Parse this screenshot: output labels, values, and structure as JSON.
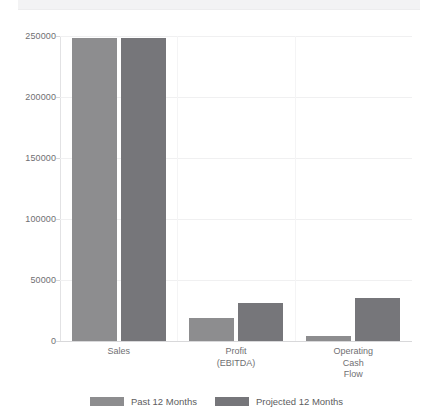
{
  "chart_data": {
    "type": "bar",
    "title": "",
    "xlabel": "",
    "ylabel": "",
    "categories": [
      "Sales",
      "Profit\n(EBITDA)",
      "Operating\nCash\nFlow"
    ],
    "series": [
      {
        "name": "Past 12 Months",
        "color": "#8d8d8f",
        "values": [
          248000,
          19000,
          4500
        ]
      },
      {
        "name": "Projected 12 Months",
        "color": "#76767a",
        "values": [
          248000,
          31000,
          35000
        ]
      }
    ],
    "ylim": [
      0,
      250000
    ],
    "yticks": [
      0,
      50000,
      100000,
      150000,
      200000,
      250000
    ],
    "ytick_labels": [
      "0",
      "50000",
      "100000",
      "150000",
      "200000",
      "250000"
    ],
    "grid": true,
    "legend_position": "bottom"
  },
  "legend": {
    "items": [
      {
        "label": "Past 12 Months"
      },
      {
        "label": "Projected 12 Months"
      }
    ]
  }
}
